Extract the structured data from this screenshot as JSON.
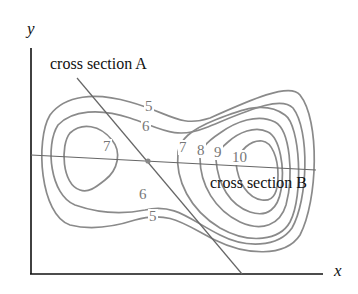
{
  "diagram": {
    "axes": {
      "x_label": "x",
      "y_label": "y"
    },
    "cross_sections": [
      {
        "label": "cross section A"
      },
      {
        "label": "cross section B"
      }
    ],
    "contour_labels": {
      "upper_5": "5",
      "upper_6": "6",
      "left_7": "7",
      "right_7": "7",
      "right_8": "8",
      "right_9": "9",
      "right_10": "10",
      "lower_6": "6",
      "lower_5": "5"
    },
    "colors": {
      "axis": "#111111",
      "contour": "#8a8a8a",
      "section_line": "#666666"
    }
  }
}
